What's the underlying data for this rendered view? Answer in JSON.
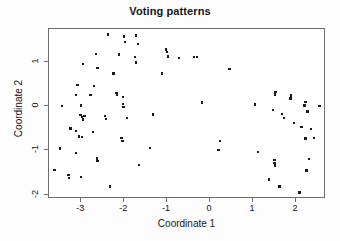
{
  "chart_data": {
    "type": "scatter",
    "title": "Voting patterns",
    "xlabel": "Coordinate 1",
    "ylabel": "Coordinate 2",
    "xlim": [
      -3.75,
      2.7
    ],
    "ylim": [
      -2.1,
      1.75
    ],
    "xticks": [
      -3,
      -2,
      -1,
      0,
      1,
      2
    ],
    "xticklabels": [
      "-3",
      "-2",
      "-1",
      "0",
      "1",
      "2"
    ],
    "yticks": [
      1,
      0,
      -1,
      -2
    ],
    "yticklabels": [
      "1",
      "0",
      "-1",
      "-2"
    ],
    "grid": false,
    "legend": null,
    "marker": "filled-square",
    "marker_color": "#1a1a1a",
    "points": [
      [
        -2.37,
        1.63
      ],
      [
        -2.0,
        1.58
      ],
      [
        -1.72,
        1.6
      ],
      [
        -1.98,
        1.46
      ],
      [
        -1.68,
        1.41
      ],
      [
        -1.02,
        1.29
      ],
      [
        -1.0,
        1.23
      ],
      [
        -2.66,
        1.18
      ],
      [
        -2.12,
        1.17
      ],
      [
        -1.75,
        1.12
      ],
      [
        -0.98,
        1.13
      ],
      [
        -0.72,
        1.1
      ],
      [
        -0.38,
        1.12
      ],
      [
        -0.31,
        1.12
      ],
      [
        -2.96,
        0.96
      ],
      [
        -1.72,
        0.99
      ],
      [
        -2.62,
        0.87
      ],
      [
        0.45,
        0.84
      ],
      [
        -2.25,
        0.74
      ],
      [
        -1.12,
        0.74
      ],
      [
        -3.09,
        0.48
      ],
      [
        -2.7,
        0.46
      ],
      [
        -3.12,
        0.25
      ],
      [
        -2.78,
        0.26
      ],
      [
        -2.18,
        0.3
      ],
      [
        -2.16,
        0.26
      ],
      [
        -2.03,
        0.21
      ],
      [
        -3.45,
        0.0
      ],
      [
        -3.0,
        0.02
      ],
      [
        -2.03,
        0.05
      ],
      [
        -2.02,
        -0.02
      ],
      [
        1.05,
        0.04
      ],
      [
        1.52,
        0.33
      ],
      [
        1.51,
        0.27
      ],
      [
        1.88,
        0.24
      ],
      [
        1.87,
        0.18
      ],
      [
        2.22,
        0.1
      ],
      [
        2.2,
        0.02
      ],
      [
        2.55,
        0.0
      ],
      [
        -0.19,
        0.09
      ],
      [
        -3.02,
        -0.2
      ],
      [
        -2.98,
        -0.24
      ],
      [
        -2.96,
        -0.3
      ],
      [
        -2.92,
        -0.22
      ],
      [
        -2.44,
        -0.22
      ],
      [
        -2.42,
        -0.29
      ],
      [
        -1.93,
        -0.27
      ],
      [
        -1.33,
        -0.19
      ],
      [
        1.47,
        -0.09
      ],
      [
        1.67,
        -0.18
      ],
      [
        1.72,
        -0.26
      ],
      [
        2.27,
        -0.12
      ],
      [
        -3.25,
        -0.5
      ],
      [
        -3.12,
        -0.56
      ],
      [
        -2.72,
        -0.58
      ],
      [
        -3.05,
        -0.68
      ],
      [
        -2.98,
        -0.7
      ],
      [
        -2.06,
        -0.72
      ],
      [
        -2.04,
        -0.79
      ],
      [
        1.96,
        -0.38
      ],
      [
        2.13,
        -0.47
      ],
      [
        2.35,
        -0.52
      ],
      [
        0.23,
        -0.79
      ],
      [
        2.22,
        -0.73
      ],
      [
        2.42,
        -0.72
      ],
      [
        -3.5,
        -0.96
      ],
      [
        -3.12,
        -1.06
      ],
      [
        -1.4,
        -0.95
      ],
      [
        0.2,
        -0.99
      ],
      [
        1.12,
        -1.04
      ],
      [
        -2.63,
        -1.18
      ],
      [
        -2.62,
        -1.24
      ],
      [
        1.5,
        -1.22
      ],
      [
        1.5,
        -1.28
      ],
      [
        1.51,
        -1.34
      ],
      [
        2.3,
        -1.2
      ],
      [
        -1.66,
        -1.33
      ],
      [
        2.25,
        -1.45
      ],
      [
        -3.62,
        -1.44
      ],
      [
        -3.3,
        -1.55
      ],
      [
        -3.28,
        -1.62
      ],
      [
        -3.0,
        -1.6
      ],
      [
        1.37,
        -1.66
      ],
      [
        -2.33,
        -1.82
      ],
      [
        1.62,
        -1.82
      ],
      [
        2.08,
        -1.95
      ]
    ]
  }
}
